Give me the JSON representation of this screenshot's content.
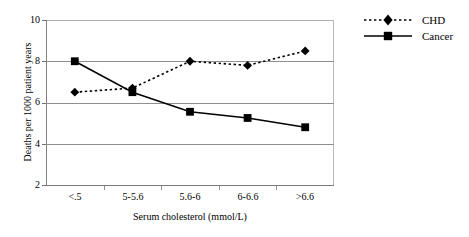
{
  "chart_data": {
    "type": "line",
    "title": "",
    "subtitle": "",
    "xlabel": "Serum cholesterol (mmol/L)",
    "ylabel": "Deaths per 1000 patient years",
    "categories": [
      "<.5",
      "5-5.6",
      "5.6-6",
      "6-6.6",
      ">6.6"
    ],
    "series": [
      {
        "name": "CHD",
        "values": [
          6.5,
          6.7,
          8.0,
          7.8,
          8.5
        ],
        "marker": "diamond",
        "linestyle": "dotted",
        "color": "#000000"
      },
      {
        "name": "Cancer",
        "values": [
          8.0,
          6.5,
          5.55,
          5.25,
          4.8
        ],
        "marker": "square",
        "linestyle": "solid",
        "color": "#000000"
      }
    ],
    "ylim": [
      2,
      10
    ],
    "yticks": [
      2,
      4,
      6,
      8,
      10
    ],
    "ytick_labels": [
      "2",
      "4",
      "6",
      "8",
      "10"
    ],
    "grid": true,
    "grid_axis": "y",
    "legend_position": "right",
    "annotations": []
  },
  "legend": {
    "items": [
      {
        "label": "CHD"
      },
      {
        "label": "Cancer"
      }
    ]
  },
  "axes": {
    "y_title": "Deaths per 1000 patient years",
    "x_title": "Serum cholesterol (mmol/L)"
  }
}
